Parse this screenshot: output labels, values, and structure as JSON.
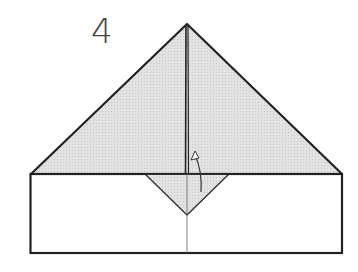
{
  "diagram": {
    "type": "origami folding instruction",
    "step_number": "4",
    "colors": {
      "paper_shaded": "#dcdcdc",
      "paper_white": "#ffffff",
      "outline": "#222222",
      "crease": "#555555"
    },
    "shapes": {
      "large_triangle": {
        "apex": [
          187,
          24
        ],
        "base_left": [
          31,
          174
        ],
        "base_right": [
          342,
          174
        ]
      },
      "rectangle": {
        "x": 30,
        "y": 174,
        "width": 312,
        "height": 79
      },
      "small_triangle_flap": {
        "left": [
          145,
          174
        ],
        "right": [
          229,
          174
        ],
        "tip": [
          187,
          215
        ]
      },
      "center_crease": {
        "x": 187,
        "y1": 24,
        "y2": 253
      }
    },
    "annotations": [
      {
        "kind": "fold-up-arrow",
        "description": "curved arrow indicating flap folds upward"
      }
    ]
  }
}
